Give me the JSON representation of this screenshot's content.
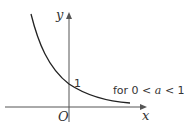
{
  "diagram": {
    "axes": {
      "x_label": "x",
      "y_label": "y",
      "origin_label": "O"
    },
    "y_intercept_label": "1",
    "condition": {
      "prefix": "for 0 < ",
      "variable": "a",
      "suffix": " < 1"
    },
    "colors": {
      "curve": "#222222",
      "axis": "#555555",
      "text": "#333333"
    }
  }
}
